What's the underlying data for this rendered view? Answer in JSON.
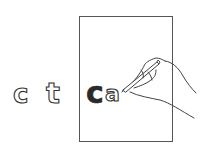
{
  "illustration": {
    "description": "Hand tracing letters on a sheet of paper",
    "loose_letters": [
      {
        "char": "c",
        "style": "outline"
      },
      {
        "char": "t",
        "style": "outline"
      }
    ],
    "paper_letters": [
      {
        "char": "c",
        "style": "filled"
      },
      {
        "char": "a",
        "style": "outline"
      }
    ],
    "colors": {
      "ink": "#333333",
      "paper": "#ffffff",
      "background": "#ffffff"
    }
  }
}
